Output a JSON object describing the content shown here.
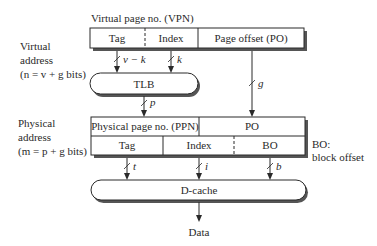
{
  "virtual": {
    "label_line1": "Virtual",
    "label_line2": "address",
    "label_line3": "(n = v + g bits)",
    "vpn_caption": "Virtual page no. (VPN)",
    "fields": {
      "tag": "Tag",
      "index": "Index",
      "offset": "Page offset (PO)"
    },
    "widths": {
      "tag": "v − k",
      "index": "k",
      "offset": "g"
    }
  },
  "tlb": {
    "label": "TLB",
    "out_width": "p"
  },
  "physical": {
    "label_line1": "Physical",
    "label_line2": "address",
    "label_line3": "(m = p + g bits)",
    "row1": {
      "ppn": "Physical page no. (PPN)",
      "po": "PO"
    },
    "row2": {
      "tag": "Tag",
      "index": "Index",
      "bo": "BO"
    },
    "widths": {
      "tag": "t",
      "index": "i",
      "bo": "b"
    }
  },
  "legend": {
    "line1": "BO:",
    "line2": "block offset"
  },
  "dcache": {
    "label": "D-cache"
  },
  "output": {
    "label": "Data"
  },
  "colors": {
    "line": "#2a2a2a",
    "shadow": "#555555",
    "background": "#ffffff"
  }
}
